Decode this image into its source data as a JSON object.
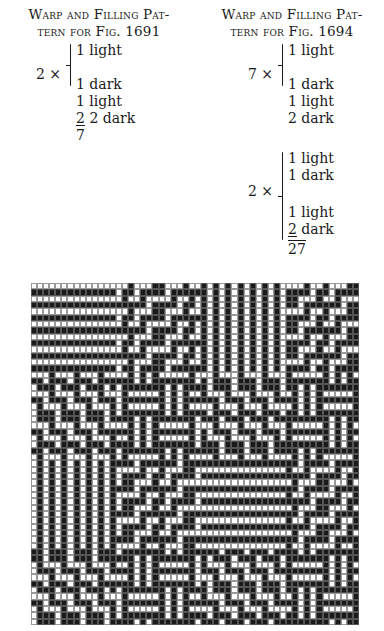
{
  "left": {
    "heading_line1": "Warp and Filling Pat-",
    "heading_line2": "tern for Fig. 1691",
    "group": {
      "multiplier": "2 ×",
      "lines": [
        "1 light",
        "1 dark"
      ]
    },
    "after": [
      "1 light",
      "2 dark"
    ],
    "total_num": "2",
    "total_den": "7"
  },
  "right": {
    "heading_line1": "Warp and Filling Pat-",
    "heading_line2": "tern for Fig. 1694",
    "group1": {
      "multiplier": "7 ×",
      "lines": [
        "1 light",
        "1 dark"
      ]
    },
    "after1": [
      "1 light",
      "2 dark"
    ],
    "group2": {
      "multiplier": "2 ×",
      "lines": [
        "1 light",
        "1 dark",
        "1 light",
        "2 dark"
      ]
    },
    "total": "27"
  },
  "grid": {
    "columns": 54,
    "rows": 54,
    "thread_pattern": "LDLDLDLDLDLDLDLDDLDLDDLDLDD",
    "dark_color": "#1a1a1a",
    "light_color": "#ffffff"
  }
}
